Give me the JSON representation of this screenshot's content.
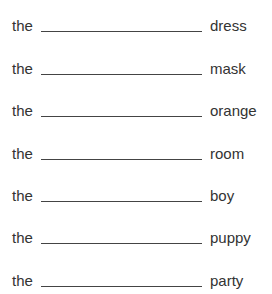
{
  "worksheet": {
    "rows": [
      {
        "article": "the",
        "blank": "",
        "word": "dress"
      },
      {
        "article": "the",
        "blank": "",
        "word": "mask"
      },
      {
        "article": "the",
        "blank": "",
        "word": "orange"
      },
      {
        "article": "the",
        "blank": "",
        "word": "room"
      },
      {
        "article": "the",
        "blank": "",
        "word": "boy"
      },
      {
        "article": "the",
        "blank": "",
        "word": "puppy"
      },
      {
        "article": "the",
        "blank": "",
        "word": "party"
      }
    ]
  }
}
